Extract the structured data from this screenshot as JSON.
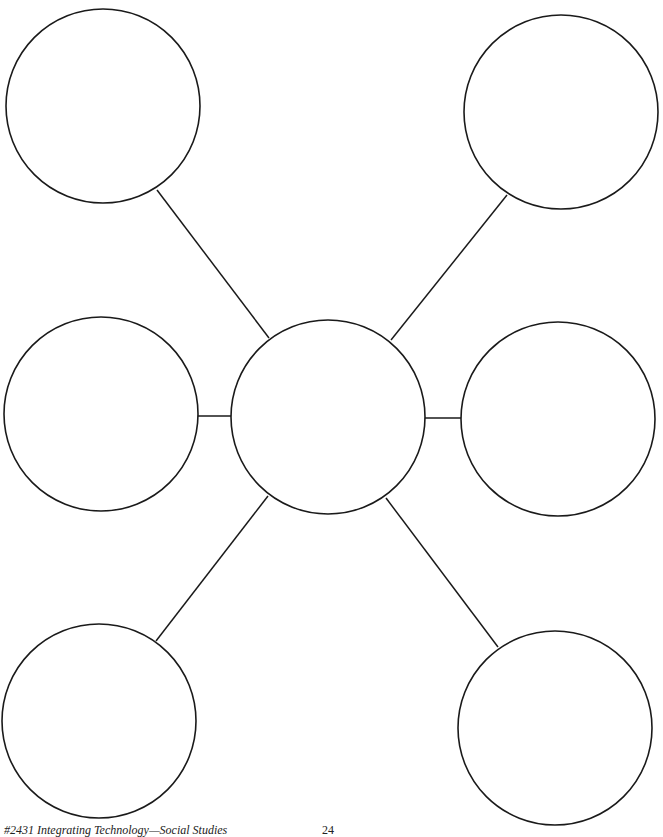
{
  "diagram": {
    "type": "web-organizer",
    "stroke_color": "#1a1a1a",
    "background_color": "#ffffff",
    "center_node": {
      "id": "center",
      "cx": 328,
      "cy": 417,
      "r": 97,
      "label": ""
    },
    "outer_nodes": [
      {
        "id": "top-left",
        "cx": 103,
        "cy": 106,
        "r": 97,
        "label": ""
      },
      {
        "id": "top-right",
        "cx": 561,
        "cy": 112,
        "r": 97,
        "label": ""
      },
      {
        "id": "middle-left",
        "cx": 101,
        "cy": 414,
        "r": 97,
        "label": ""
      },
      {
        "id": "middle-right",
        "cx": 558,
        "cy": 419,
        "r": 97,
        "label": ""
      },
      {
        "id": "bottom-left",
        "cx": 99,
        "cy": 721,
        "r": 97,
        "label": ""
      },
      {
        "id": "bottom-right",
        "cx": 555,
        "cy": 728,
        "r": 97,
        "label": ""
      }
    ],
    "connectors": [
      {
        "from": "center",
        "to": "top-left",
        "x1": 269,
        "y1": 338,
        "x2": 157,
        "y2": 190
      },
      {
        "from": "center",
        "to": "top-right",
        "x1": 391,
        "y1": 340,
        "x2": 507,
        "y2": 195
      },
      {
        "from": "center",
        "to": "middle-left",
        "x1": 233,
        "y1": 416,
        "x2": 198,
        "y2": 416
      },
      {
        "from": "center",
        "to": "middle-right",
        "x1": 424,
        "y1": 418,
        "x2": 462,
        "y2": 418
      },
      {
        "from": "center",
        "to": "bottom-left",
        "x1": 268,
        "y1": 496,
        "x2": 156,
        "y2": 641
      },
      {
        "from": "center",
        "to": "bottom-right",
        "x1": 386,
        "y1": 498,
        "x2": 498,
        "y2": 647
      }
    ]
  },
  "footer": {
    "publication": "#2431 Integrating Technology—Social Studies",
    "page_number": "24"
  }
}
